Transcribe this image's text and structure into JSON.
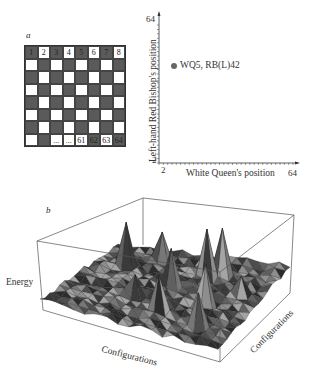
{
  "panel_a": {
    "label": "a",
    "board": {
      "rows": 8,
      "cols": 8,
      "top_row_labels": [
        "1",
        "2",
        "3",
        "4",
        "5",
        "6",
        "7",
        "8"
      ],
      "bottom_row_labels": [
        "",
        "",
        "...",
        "...",
        "61",
        "62",
        "63",
        "64"
      ],
      "dark_color": "#5a5a5a",
      "light_color": "#ffffff"
    }
  },
  "panel_a_plot": {
    "ylabel": "Left-hand Red Bishop's position",
    "xlabel": "White Queen's position",
    "x_min_label": "2",
    "x_max_label": "64",
    "y_min_label": "2",
    "y_max_label": "64",
    "point_label": "WQ5, RB(L)42"
  },
  "panel_b": {
    "label": "b",
    "zlabel": "Energy",
    "xlabel": "Configurations",
    "ylabel": "Configurations"
  },
  "chart_data": [
    {
      "type": "scatter",
      "title": "",
      "xlabel": "White Queen's position",
      "ylabel": "Left-hand Red Bishop's position",
      "xlim": [
        2,
        64
      ],
      "ylim": [
        2,
        64
      ],
      "x_ticks": [
        "2",
        "64"
      ],
      "y_ticks": [
        "2",
        "64"
      ],
      "points": [
        {
          "x": 5,
          "y": 42,
          "label": "WQ5, RB(L)42"
        }
      ]
    },
    {
      "type": "surface",
      "title": "",
      "xlabel": "Configurations",
      "ylabel": "Configurations",
      "zlabel": "Energy",
      "description": "Rugged energy landscape over a grid of configurations with several sharp spikes"
    }
  ]
}
